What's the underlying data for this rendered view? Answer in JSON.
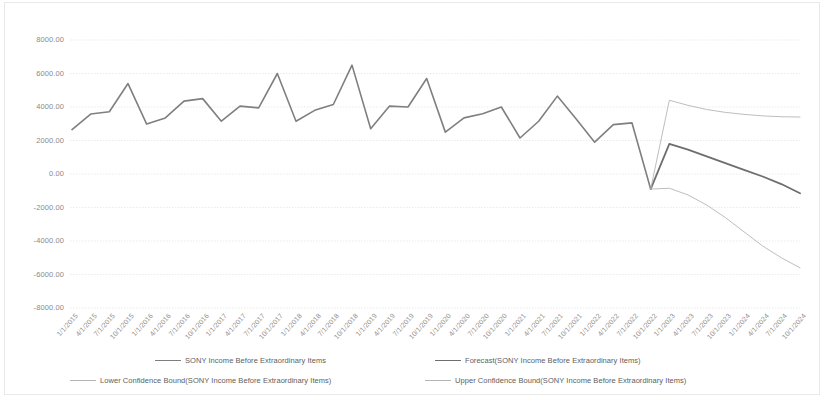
{
  "chart_data": {
    "type": "line",
    "title": "",
    "xlabel": "",
    "ylabel": "",
    "ylim": [
      -8000,
      8000
    ],
    "ytick_step": 2000,
    "grid": true,
    "legend_position": "bottom",
    "yticks": [
      "8000.00",
      "6000.00",
      "4000.00",
      "2000.00",
      "0.00",
      "-2000.00",
      "-4000.00",
      "-6000.00",
      "-8000.00"
    ],
    "categories": [
      "1/1/2015",
      "4/1/2015",
      "7/1/2015",
      "10/1/2015",
      "1/1/2016",
      "4/1/2016",
      "7/1/2016",
      "10/1/2016",
      "1/1/2017",
      "4/1/2017",
      "7/1/2017",
      "10/1/2017",
      "1/1/2018",
      "4/1/2018",
      "7/1/2018",
      "10/1/2018",
      "1/1/2019",
      "4/1/2019",
      "7/1/2019",
      "10/1/2019",
      "1/1/2020",
      "4/1/2020",
      "7/1/2020",
      "10/1/2020",
      "1/1/2021",
      "4/1/2021",
      "7/1/2021",
      "10/1/2021",
      "1/1/2022",
      "4/1/2022",
      "7/1/2022",
      "10/1/2022",
      "1/1/2023",
      "4/1/2023",
      "7/1/2023",
      "10/1/2023",
      "1/1/2024",
      "4/1/2024",
      "7/1/2024",
      "10/1/2024"
    ],
    "series": [
      {
        "name": "SONY Income Before Extraordinary Items",
        "style": "solid",
        "color": "#7f7f7f",
        "width": 1.6,
        "values": [
          2650,
          3580,
          3720,
          5400,
          2980,
          3350,
          4350,
          4500,
          3150,
          4050,
          3950,
          6000,
          3150,
          3800,
          4150,
          6500,
          2700,
          4050,
          4000,
          5700,
          2500,
          3350,
          3600,
          4000,
          2150,
          3150,
          4650,
          3300,
          1900,
          2950,
          3050,
          -900,
          null,
          null,
          null,
          null,
          null,
          null,
          null,
          null
        ]
      },
      {
        "name": "Forecast(SONY Income Before Extraordinary Items)",
        "style": "solid",
        "color": "#6e6e6e",
        "width": 1.8,
        "values": [
          null,
          null,
          null,
          null,
          null,
          null,
          null,
          null,
          null,
          null,
          null,
          null,
          null,
          null,
          null,
          null,
          null,
          null,
          null,
          null,
          null,
          null,
          null,
          null,
          null,
          null,
          null,
          null,
          null,
          null,
          null,
          -900,
          1800,
          1450,
          1050,
          650,
          250,
          -150,
          -600,
          -1150
        ]
      },
      {
        "name": "Lower Confidence Bound(SONY Income Before Extraordinary Items)",
        "style": "solid",
        "color": "#b5b5b5",
        "width": 0.9,
        "values": [
          null,
          null,
          null,
          null,
          null,
          null,
          null,
          null,
          null,
          null,
          null,
          null,
          null,
          null,
          null,
          null,
          null,
          null,
          null,
          null,
          null,
          null,
          null,
          null,
          null,
          null,
          null,
          null,
          null,
          null,
          null,
          -900,
          -850,
          -1250,
          -1850,
          -2600,
          -3450,
          -4300,
          -5000,
          -5600
        ]
      },
      {
        "name": "Upper Confidence Bound(SONY Income Before Extraordinary Items)",
        "style": "solid",
        "color": "#b5b5b5",
        "width": 0.9,
        "values": [
          null,
          null,
          null,
          null,
          null,
          null,
          null,
          null,
          null,
          null,
          null,
          null,
          null,
          null,
          null,
          null,
          null,
          null,
          null,
          null,
          null,
          null,
          null,
          null,
          null,
          null,
          null,
          null,
          null,
          null,
          null,
          -900,
          4400,
          4100,
          3850,
          3680,
          3560,
          3470,
          3420,
          3400
        ]
      }
    ]
  },
  "legend": {
    "items": [
      {
        "label": "SONY Income Before Extraordinary Items",
        "color": "#7f7f7f",
        "thickness": "1.8px",
        "left": 155,
        "top": 4
      },
      {
        "label": "Forecast(SONY Income Before Extraordinary Items)",
        "color": "#6e6e6e",
        "thickness": "1.8px",
        "left": 435,
        "top": 4
      },
      {
        "label": "Lower Confidence Bound(SONY Income Before Extraordinary Items)",
        "color": "#b5b5b5",
        "thickness": "1px",
        "left": 70,
        "top": 24
      },
      {
        "label": "Upper Confidence Bound(SONY Income Before Extraordinary Items)",
        "color": "#b5b5b5",
        "thickness": "1px",
        "left": 425,
        "top": 24
      }
    ]
  },
  "plot": {
    "left": 72,
    "right": 800,
    "top": 40,
    "bottom": 308
  }
}
